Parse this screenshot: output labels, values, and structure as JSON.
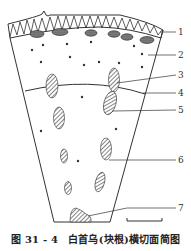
{
  "figure": {
    "number": "图 31 - 4",
    "title": "白首乌(块根)横切面简图"
  },
  "labels": [
    {
      "id": 1,
      "text": "1",
      "y": 32
    },
    {
      "id": 2,
      "text": "2",
      "y": 55
    },
    {
      "id": 3,
      "text": "3",
      "y": 75
    },
    {
      "id": 4,
      "text": "4",
      "y": 93
    },
    {
      "id": 5,
      "text": "5",
      "y": 110
    },
    {
      "id": 6,
      "text": "6",
      "y": 160
    },
    {
      "id": 7,
      "text": "7",
      "y": 208
    }
  ],
  "colors": {
    "line": "#333333",
    "background": "#ffffff"
  }
}
